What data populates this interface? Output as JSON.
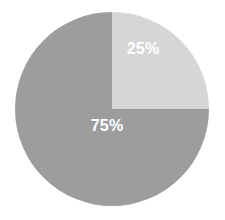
{
  "chart_data": {
    "type": "pie",
    "title": "",
    "categories": [
      "25%",
      "75%"
    ],
    "values": [
      25,
      75
    ],
    "labels": [
      "25%",
      "75%"
    ],
    "colors": [
      "#d6d6d6",
      "#9d9d9d"
    ],
    "legend": "none",
    "grid": false,
    "background": "#ffffff",
    "label_color": "#ffffff",
    "start_angle_deg": 0,
    "direction": "clockwise",
    "geometry": {
      "center_x": 112,
      "center_y": 109,
      "radius": 97
    },
    "slices": [
      {
        "name": "25%",
        "value": 25,
        "label": "25%",
        "color": "#d6d6d6",
        "start_deg": 0,
        "sweep_deg": 90,
        "label_x": 143,
        "label_y": 49
      },
      {
        "name": "75%",
        "value": 75,
        "label": "75%",
        "color": "#9d9d9d",
        "start_deg": 90,
        "sweep_deg": 270,
        "label_x": 107,
        "label_y": 126
      }
    ]
  },
  "accessibility": {
    "description": "Pie chart with two slices: 25% light gray and 75% medium gray"
  }
}
